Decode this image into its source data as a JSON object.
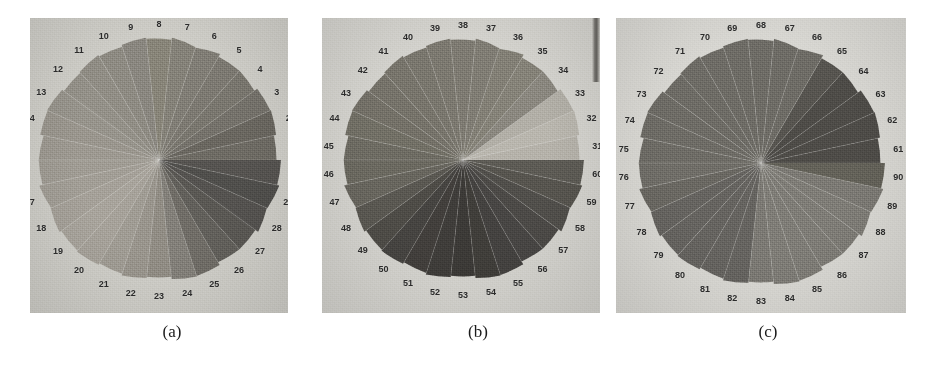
{
  "figure": {
    "background_color": "#ffffff",
    "panel_background_color": "#d5d4cf",
    "label_color": "#2b2b2b"
  },
  "panels": [
    {
      "id": "panel-a",
      "caption": "(a)",
      "x": 30,
      "y": 18,
      "w": 258,
      "h": 295,
      "caption_x": 172,
      "caption_y": 322,
      "disk": {
        "cx": 129,
        "cy": 142,
        "r": 123
      },
      "photo_color": "#cfcec8",
      "sector_count": 30,
      "label_start_number": 1,
      "label_end_number": 30,
      "sector_fills": [
        "#6e6b64",
        "#6a6760",
        "#75726b",
        "#7a776f",
        "#7d7a72",
        "#817e76",
        "#858279",
        "#888579",
        "#8a8780",
        "#8e8b83",
        "#918e86",
        "#949189",
        "#97948c",
        "#9a968e",
        "#9d9991",
        "#a09c94",
        "#a29e96",
        "#a5a199",
        "#a8a49c",
        "#a6a29a",
        "#a09c94",
        "#99958d",
        "#918d85",
        "#83807a",
        "#706d67",
        "#62605b",
        "#5a5854",
        "#555350",
        "#504f4c",
        "#565451"
      ],
      "sector_labels": [
        "1",
        "2",
        "3",
        "4",
        "5",
        "6",
        "7",
        "8",
        "9",
        "10",
        "11",
        "12",
        "13",
        "14",
        "15",
        "16",
        "17",
        "18",
        "19",
        "20",
        "21",
        "22",
        "23",
        "24",
        "25",
        "26",
        "27",
        "28",
        "29",
        "30"
      ]
    },
    {
      "id": "panel-b",
      "caption": "(b)",
      "x": 322,
      "y": 18,
      "w": 278,
      "h": 295,
      "caption_x": 478,
      "caption_y": 322,
      "disk": {
        "cx": 141,
        "cy": 142,
        "r": 122
      },
      "photo_color": "#d4d3ce",
      "sector_count": 30,
      "label_start_number": 31,
      "label_end_number": 60,
      "sector_fills": [
        "#b5b2aa",
        "#b9b6ae",
        "#b2afa7",
        "#8b8880",
        "#868379",
        "#838076",
        "#807d74",
        "#7e7b72",
        "#7c7970",
        "#7a776e",
        "#78756c",
        "#76736a",
        "#747168",
        "#727066",
        "#6e6c63",
        "#6b6960",
        "#68665e",
        "#5a5852",
        "#4e4c47",
        "#464441",
        "#423f3c",
        "#3f3d3a",
        "#3c3a37",
        "#403e3a",
        "#444240",
        "#484644",
        "#4c4a47",
        "#514f4b",
        "#57554f",
        "#5d5b55"
      ],
      "sector_labels": [
        "31",
        "32",
        "33",
        "34",
        "35",
        "36",
        "37",
        "38",
        "39",
        "40",
        "41",
        "42",
        "43",
        "44",
        "45",
        "46",
        "47",
        "48",
        "49",
        "50",
        "51",
        "52",
        "53",
        "54",
        "55",
        "56",
        "57",
        "58",
        "59",
        "60"
      ]
    },
    {
      "id": "panel-c",
      "caption": "(c)",
      "x": 616,
      "y": 18,
      "w": 290,
      "h": 295,
      "caption_x": 768,
      "caption_y": 322,
      "disk": {
        "cx": 145,
        "cy": 145,
        "r": 125
      },
      "photo_color": "#d9d8d3",
      "sector_count": 30,
      "label_start_number": 61,
      "label_end_number": 90,
      "sector_fills": [
        "#4e4c48",
        "#4e4c48",
        "#4e4c48",
        "#4e4c48",
        "#575550",
        "#6e6c66",
        "#6e6c66",
        "#6e6c66",
        "#6e6c66",
        "#6e6c66",
        "#6e6c66",
        "#6e6c66",
        "#6e6c66",
        "#6e6c66",
        "#6e6c66",
        "#706e68",
        "#6a6862",
        "#666460",
        "#666460",
        "#666460",
        "#666460",
        "#666460",
        "#7c7a74",
        "#7f7d77",
        "#7f7d77",
        "#7f7d77",
        "#7f7d77",
        "#7f7d77",
        "#7c7a74",
        "#646259"
      ],
      "sector_labels": [
        "61",
        "62",
        "63",
        "64",
        "65",
        "66",
        "67",
        "68",
        "69",
        "70",
        "71",
        "72",
        "73",
        "74",
        "75",
        "76",
        "77",
        "78",
        "79",
        "80",
        "81",
        "82",
        "83",
        "84",
        "85",
        "86",
        "87",
        "88",
        "89",
        "90"
      ]
    }
  ],
  "artifacts": {
    "dark_streak": {
      "x": 592,
      "y": 18,
      "w": 8,
      "h": 64
    }
  }
}
